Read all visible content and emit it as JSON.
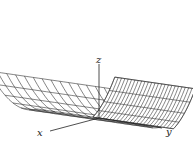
{
  "figure": {
    "surface": "z = x^2",
    "stroke_color": "#333333",
    "fill_color": "#ffffff",
    "axes": {
      "x_label": "x",
      "y_label": "y",
      "z_label": "z"
    },
    "mesh": {
      "u_lines": 11,
      "v_lines": 15
    }
  }
}
